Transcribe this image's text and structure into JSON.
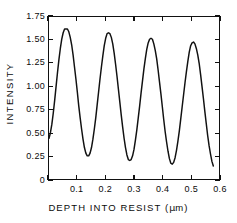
{
  "chart_data": {
    "type": "line",
    "title": "",
    "xlabel": "DEPTH INTO RESIST (µm)",
    "ylabel": "INTENSITY",
    "xlim": [
      0.0,
      0.6
    ],
    "ylim": [
      0.0,
      1.75
    ],
    "grid": false,
    "legend": "none",
    "xticks": [
      0.0,
      0.1,
      0.2,
      0.3,
      0.4,
      0.5,
      0.6
    ],
    "xticklabels": [
      "",
      "0.1",
      "0.2",
      "0.3",
      "0.4",
      "0.5",
      "0.6"
    ],
    "yticks": [
      0.0,
      0.25,
      0.5,
      0.75,
      1.0,
      1.25,
      1.5,
      1.75
    ],
    "yticklabels": [
      "0",
      "0.25",
      "0.50",
      "0.75",
      "1.00",
      "1.25",
      "1.50",
      "1.75"
    ],
    "series": [
      {
        "name": "intensity",
        "color": "#111111",
        "peaks": [
          {
            "x": 0.065,
            "y": 1.62
          },
          {
            "x": 0.192,
            "y": 1.58
          },
          {
            "x": 0.318,
            "y": 1.52
          },
          {
            "x": 0.445,
            "y": 1.48
          },
          {
            "x": 0.572,
            "y": 1.44
          }
        ],
        "troughs": [
          {
            "x": 0.121,
            "y": 0.25
          },
          {
            "x": 0.248,
            "y": 0.2
          },
          {
            "x": 0.375,
            "y": 0.16
          },
          {
            "x": 0.502,
            "y": 0.12
          }
        ],
        "x": [
          0.0,
          0.005,
          0.01,
          0.015,
          0.02,
          0.025,
          0.03,
          0.035,
          0.04,
          0.045,
          0.05,
          0.055,
          0.06,
          0.065,
          0.07,
          0.075,
          0.08,
          0.085,
          0.09,
          0.095,
          0.1,
          0.105,
          0.11,
          0.115,
          0.12,
          0.125,
          0.13,
          0.135,
          0.14,
          0.145,
          0.15,
          0.155,
          0.16,
          0.165,
          0.17,
          0.175,
          0.18,
          0.185,
          0.19,
          0.195,
          0.2,
          0.205,
          0.21,
          0.215,
          0.22,
          0.225,
          0.23,
          0.235,
          0.24,
          0.245,
          0.25,
          0.255,
          0.26,
          0.265,
          0.27,
          0.275,
          0.28,
          0.285,
          0.29,
          0.295,
          0.3,
          0.305,
          0.31,
          0.315,
          0.32,
          0.325,
          0.33,
          0.335,
          0.34,
          0.345,
          0.35,
          0.355,
          0.36,
          0.365,
          0.37,
          0.375,
          0.38,
          0.385,
          0.39,
          0.395,
          0.4,
          0.405,
          0.41,
          0.415,
          0.42,
          0.425,
          0.43,
          0.435,
          0.44,
          0.445,
          0.45,
          0.455,
          0.46,
          0.465,
          0.47,
          0.475,
          0.48,
          0.485,
          0.49,
          0.495,
          0.5,
          0.505,
          0.51,
          0.515,
          0.52,
          0.525,
          0.53,
          0.535,
          0.54,
          0.545,
          0.55,
          0.555,
          0.56,
          0.565,
          0.57,
          0.575,
          0.58
        ],
        "y": [
          0.44,
          0.5,
          0.59,
          0.71,
          0.85,
          1.0,
          1.15,
          1.29,
          1.41,
          1.51,
          1.58,
          1.62,
          1.62,
          1.62,
          1.59,
          1.53,
          1.45,
          1.34,
          1.21,
          1.08,
          0.94,
          0.79,
          0.66,
          0.54,
          0.43,
          0.34,
          0.28,
          0.25,
          0.25,
          0.28,
          0.34,
          0.43,
          0.54,
          0.66,
          0.8,
          0.94,
          1.08,
          1.21,
          1.33,
          1.44,
          1.52,
          1.57,
          1.58,
          1.57,
          1.53,
          1.46,
          1.36,
          1.24,
          1.11,
          0.97,
          0.83,
          0.69,
          0.56,
          0.44,
          0.34,
          0.26,
          0.21,
          0.2,
          0.21,
          0.25,
          0.32,
          0.42,
          0.53,
          0.66,
          0.79,
          0.93,
          1.06,
          1.19,
          1.3,
          1.4,
          1.47,
          1.51,
          1.52,
          1.51,
          1.46,
          1.39,
          1.3,
          1.18,
          1.05,
          0.92,
          0.78,
          0.64,
          0.51,
          0.4,
          0.3,
          0.22,
          0.17,
          0.16,
          0.18,
          0.23,
          0.31,
          0.41,
          0.52,
          0.65,
          0.78,
          0.91,
          1.04,
          1.16,
          1.27,
          1.37,
          1.44,
          1.47,
          1.48,
          1.46,
          1.41,
          1.34,
          1.25,
          1.13,
          1.0,
          0.87,
          0.73,
          0.6,
          0.47,
          0.36,
          0.27,
          0.19,
          0.14
        ]
      }
    ]
  }
}
